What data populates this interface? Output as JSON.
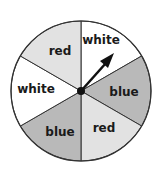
{
  "spinner": {
    "sectors": [
      {
        "label": "white",
        "color": "#ffffff"
      },
      {
        "label": "blue",
        "color": "#b9b9b9"
      },
      {
        "label": "red",
        "color": "#e2e2e2"
      },
      {
        "label": "blue",
        "color": "#b9b9b9"
      },
      {
        "label": "white",
        "color": "#ffffff"
      },
      {
        "label": "red",
        "color": "#e2e2e2"
      }
    ],
    "arrow": {
      "points_to": "white"
    }
  }
}
